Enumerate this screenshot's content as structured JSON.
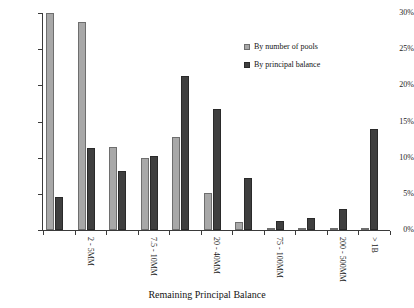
{
  "chart_data": {
    "type": "bar",
    "title": "",
    "xlabel": "Remaining Principal Balance",
    "ylabel": "",
    "ylim": [
      0,
      30
    ],
    "ytick_labels": [
      "0%",
      "5%",
      "10%",
      "15%",
      "20%",
      "25%",
      "30%"
    ],
    "ytick_values": [
      0,
      5,
      10,
      15,
      20,
      25,
      30
    ],
    "grid": false,
    "legend_position": "top-right",
    "categories": [
      "",
      "2 - 5MM",
      "",
      "7.5 - 10MM",
      "",
      "20 - 40MM",
      "",
      "75 - 100MM",
      "",
      "200 - 500MM",
      "> 1B"
    ],
    "visible_tick_labels": [
      "2 - 5MM",
      "7.5 - 10MM",
      "20 - 40MM",
      "75 - 100MM",
      "200 - 500MM",
      "> 1B"
    ],
    "series": [
      {
        "name": "By number of pools",
        "color": "#a8a8a8",
        "values": [
          30.0,
          28.7,
          11.5,
          9.9,
          12.8,
          5.1,
          1.1,
          0.2,
          0.1,
          0.1,
          0.1
        ]
      },
      {
        "name": "By principal balance",
        "color": "#3f3f3f",
        "values": [
          4.5,
          11.3,
          8.1,
          10.2,
          21.3,
          16.7,
          7.2,
          1.3,
          1.6,
          2.9,
          13.9
        ]
      }
    ]
  },
  "axis": {
    "x_title": "Remaining Principal Balance"
  },
  "legend": {
    "entries": [
      {
        "label": "By number of pools",
        "color": "#a8a8a8"
      },
      {
        "label": "By principal balance",
        "color": "#3f3f3f"
      }
    ]
  }
}
